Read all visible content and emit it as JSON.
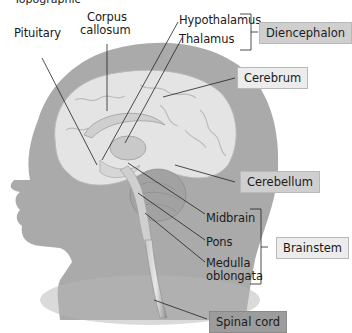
{
  "figure": {
    "top_caption_fragment": "Topographic"
  },
  "labels": {
    "pituitary": "Pituitary",
    "corpus_callosum_line1": "Corpus",
    "corpus_callosum_line2": "callosum",
    "hypothalamus": "Hypothalamus",
    "thalamus": "Thalamus",
    "midbrain": "Midbrain",
    "pons": "Pons",
    "medulla_line1": "Medulla",
    "medulla_line2": "oblongata"
  },
  "boxes": {
    "diencephalon": "Diencephalon",
    "cerebrum": "Cerebrum",
    "cerebellum": "Cerebellum",
    "brainstem": "Brainstem",
    "spinal_cord": "Spinal cord"
  },
  "colors": {
    "head_silhouette": "#a9a9a9",
    "brain_tissue": "#e6e6e6",
    "box_light": "#ececec",
    "box_mid": "#cfcfcf",
    "box_dark": "#9c9c9c",
    "leader_line": "#222222"
  }
}
